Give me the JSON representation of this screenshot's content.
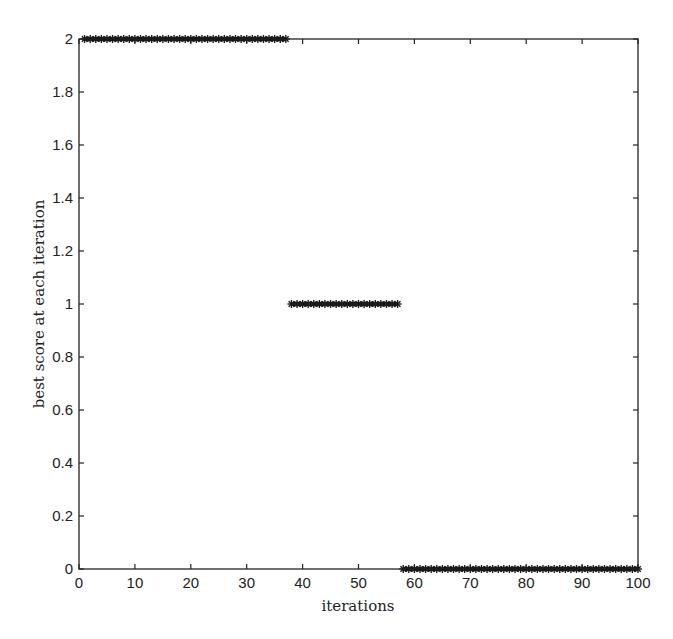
{
  "chart_data": {
    "type": "scatter",
    "title": "",
    "xlabel": "iterations",
    "ylabel": "best score at each iteration",
    "xlim": [
      0,
      100
    ],
    "ylim": [
      0,
      2
    ],
    "xticks": [
      0,
      10,
      20,
      30,
      40,
      50,
      60,
      70,
      80,
      90,
      100
    ],
    "yticks": [
      0,
      0.2,
      0.4,
      0.6,
      0.8,
      1,
      1.2,
      1.4,
      1.6,
      1.8,
      2
    ],
    "xtick_labels": [
      "0",
      "10",
      "20",
      "30",
      "40",
      "50",
      "60",
      "70",
      "80",
      "90",
      "100"
    ],
    "ytick_labels": [
      "0",
      "0.2",
      "0.4",
      "0.6",
      "0.8",
      "1",
      "1.2",
      "1.4",
      "1.6",
      "1.8",
      "2"
    ],
    "grid": false,
    "marker": "*",
    "color": "#1a1a1a",
    "series": [
      {
        "name": "best score",
        "segments": [
          {
            "x_start": 1,
            "x_end": 37,
            "y": 2
          },
          {
            "x_start": 38,
            "x_end": 57,
            "y": 1
          },
          {
            "x_start": 58,
            "x_end": 100,
            "y": 0
          }
        ]
      }
    ]
  }
}
